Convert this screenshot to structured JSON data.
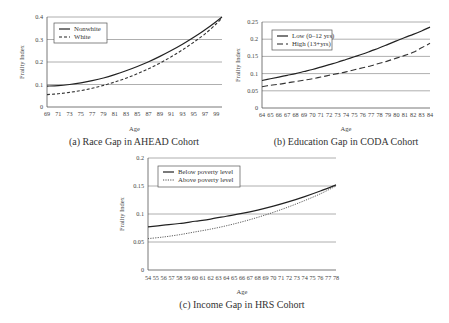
{
  "chart_data": [
    {
      "id": "a",
      "type": "line",
      "title": "(a) Race Gap in AHEAD Cohort",
      "xlabel": "Age",
      "ylabel": "Frailty Index",
      "ylim": [
        0,
        0.4
      ],
      "yticks": [
        "0",
        "0.1",
        "0.2",
        "0.3",
        "0.4"
      ],
      "xlim": [
        69,
        100
      ],
      "xticks": [
        "69",
        "71",
        "73",
        "75",
        "77",
        "79",
        "81",
        "83",
        "85",
        "87",
        "89",
        "91",
        "93",
        "95",
        "97",
        "99"
      ],
      "grid": "horizontal",
      "legend_position": "upper-left",
      "x": [
        69,
        71,
        73,
        75,
        77,
        79,
        81,
        83,
        85,
        87,
        89,
        91,
        93,
        95,
        97,
        99,
        100
      ],
      "series": [
        {
          "name": "Nonwhite",
          "style": "solid",
          "values": [
            0.093,
            0.095,
            0.1,
            0.107,
            0.117,
            0.129,
            0.144,
            0.161,
            0.18,
            0.201,
            0.225,
            0.251,
            0.279,
            0.31,
            0.343,
            0.38,
            0.4
          ]
        },
        {
          "name": "White",
          "style": "dashed",
          "values": [
            0.055,
            0.059,
            0.065,
            0.073,
            0.083,
            0.096,
            0.111,
            0.128,
            0.148,
            0.17,
            0.195,
            0.223,
            0.254,
            0.288,
            0.325,
            0.37,
            0.395
          ]
        }
      ]
    },
    {
      "id": "b",
      "type": "line",
      "title": "(b) Education Gap in CODA Cohort",
      "xlabel": "Age",
      "ylabel": "Frailty Index",
      "ylim": [
        0,
        0.25
      ],
      "yticks": [
        "0",
        "0.05",
        "0.1",
        "0.15",
        "0.2",
        "0.25"
      ],
      "xlim": [
        64,
        84
      ],
      "xticks": [
        "64",
        "65",
        "66",
        "67",
        "68",
        "69",
        "70",
        "71",
        "72",
        "73",
        "74",
        "75",
        "76",
        "77",
        "78",
        "79",
        "80",
        "81",
        "82",
        "83",
        "84"
      ],
      "grid": "horizontal",
      "legend_position": "upper-left",
      "x": [
        64,
        65,
        66,
        67,
        68,
        69,
        70,
        71,
        72,
        73,
        74,
        75,
        76,
        77,
        78,
        79,
        80,
        81,
        82,
        83,
        84
      ],
      "series": [
        {
          "name": "Low (0–12 yrs)",
          "style": "solid",
          "values": [
            0.08,
            0.085,
            0.09,
            0.095,
            0.1,
            0.106,
            0.112,
            0.119,
            0.126,
            0.133,
            0.141,
            0.149,
            0.157,
            0.166,
            0.175,
            0.185,
            0.195,
            0.205,
            0.214,
            0.224,
            0.235
          ]
        },
        {
          "name": "High (13+yrs)",
          "style": "dashed",
          "values": [
            0.062,
            0.066,
            0.069,
            0.073,
            0.077,
            0.081,
            0.085,
            0.09,
            0.095,
            0.1,
            0.105,
            0.111,
            0.117,
            0.123,
            0.13,
            0.137,
            0.145,
            0.153,
            0.162,
            0.175,
            0.188
          ]
        }
      ]
    },
    {
      "id": "c",
      "type": "line",
      "title": "(c) Income Gap in HRS Cohort",
      "xlabel": "Age",
      "ylabel": "Frailty Index",
      "ylim": [
        0,
        0.2
      ],
      "yticks": [
        "0",
        "0.05",
        "0.1",
        "0.15",
        "0.2"
      ],
      "xlim": [
        54,
        78
      ],
      "xticks": [
        "54",
        "55",
        "56",
        "57",
        "58",
        "59",
        "60",
        "61",
        "62",
        "63",
        "64",
        "65",
        "66",
        "67",
        "68",
        "69",
        "70",
        "71",
        "72",
        "73",
        "74",
        "75",
        "76",
        "77",
        "78"
      ],
      "grid": "horizontal",
      "legend_position": "upper-left",
      "x": [
        54,
        56,
        58,
        60,
        62,
        64,
        66,
        68,
        70,
        72,
        74,
        76,
        78
      ],
      "series": [
        {
          "name": "Below poverty level",
          "style": "solid",
          "values": [
            0.077,
            0.08,
            0.083,
            0.087,
            0.091,
            0.096,
            0.101,
            0.107,
            0.114,
            0.122,
            0.131,
            0.141,
            0.152
          ]
        },
        {
          "name": "Above poverty level",
          "style": "dotted",
          "values": [
            0.056,
            0.059,
            0.063,
            0.068,
            0.073,
            0.079,
            0.086,
            0.094,
            0.103,
            0.113,
            0.124,
            0.136,
            0.15
          ]
        }
      ]
    }
  ]
}
